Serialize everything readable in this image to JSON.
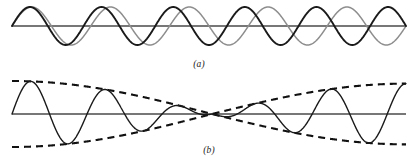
{
  "figure": {
    "width": 416,
    "height": 163,
    "background": "#ffffff"
  },
  "panels": [
    {
      "id": "panel-a",
      "label": "(a)",
      "label_x": 199,
      "label_y": 59,
      "axis": {
        "x_start": 12,
        "x_end": 406,
        "y": 26,
        "color": "#4a4a4a",
        "width": 1.3
      },
      "curves": [
        {
          "name": "wave-1",
          "color": "#8d8d8d",
          "width": 1.5,
          "dash": "none",
          "amplitude": 19,
          "cycles": 5.0,
          "phase_deg": 0,
          "baseline": 26
        },
        {
          "name": "wave-2",
          "color": "#1a1a1a",
          "width": 1.9,
          "dash": "none",
          "amplitude": 19,
          "cycles": 5.5,
          "phase_deg": 0,
          "baseline": 26
        }
      ]
    },
    {
      "id": "panel-b",
      "label": "(b)",
      "label_x": 209,
      "label_y": 145,
      "axis": {
        "x_start": 12,
        "x_end": 406,
        "y": 114,
        "color": "#4a4a4a",
        "width": 1.3
      },
      "node_x": 212,
      "curves": [
        {
          "name": "beat-sum-wave",
          "color": "#1a1a1a",
          "width": 1.4,
          "dash": "none",
          "amplitude": 33,
          "cycles": 5.25,
          "phase_deg": 0,
          "baseline": 114
        },
        {
          "name": "envelope-upper",
          "color": "#111111",
          "width": 2.1,
          "dash": "7,5",
          "amplitude": 33,
          "baseline": 114
        },
        {
          "name": "envelope-lower",
          "color": "#111111",
          "width": 2.1,
          "dash": "7,5",
          "amplitude": 33,
          "baseline": 114
        }
      ]
    }
  ],
  "chart_data": {
    "type": "line",
    "title": "",
    "subtitle": "",
    "xlabel": "",
    "ylabel": "",
    "grid": false,
    "legend": false,
    "axis_range_x": [
      0,
      1
    ],
    "axis_range_y": [
      -1,
      1
    ],
    "panel_labels": [
      "(a)",
      "(b)"
    ],
    "description_a": "Two sinusoidal waves of slightly different frequency plotted on a common axis; they begin in phase at the left, drift out of phase toward the middle, and come back into phase at the right.",
    "description_b": "The superposition (sum) of the two waves of panel (a), showing a beat: the resultant sinusoid is bounded by a dashed cosine envelope that narrows to a node near the centre and widens again toward each end.",
    "series": [
      {
        "name": "wave-1",
        "panel": "a",
        "style": "solid",
        "color": "#8d8d8d",
        "amplitude": 1.0,
        "cycles": 5.0,
        "phase_deg": 0
      },
      {
        "name": "wave-2",
        "panel": "a",
        "style": "solid",
        "color": "#1a1a1a",
        "amplitude": 1.0,
        "cycles": 5.5,
        "phase_deg": 0
      },
      {
        "name": "beat-sum-wave",
        "panel": "b",
        "style": "solid",
        "color": "#1a1a1a",
        "amplitude": 1.0,
        "cycles": 5.25,
        "phase_deg": 0
      },
      {
        "name": "envelope-upper",
        "panel": "b",
        "style": "dashed",
        "color": "#111111",
        "amplitude": 1.0,
        "cycles": 0.25,
        "phase_deg": 0
      },
      {
        "name": "envelope-lower",
        "panel": "b",
        "style": "dashed",
        "color": "#111111",
        "amplitude": -1.0,
        "cycles": 0.25,
        "phase_deg": 0
      }
    ]
  }
}
